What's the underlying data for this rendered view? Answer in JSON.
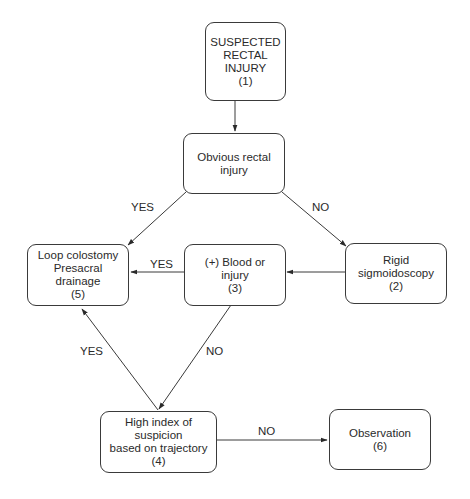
{
  "diagram": {
    "nodes": [
      {
        "id": "1",
        "lines": [
          "SUSPECTED",
          "RECTAL",
          "INJURY",
          "(1)"
        ]
      },
      {
        "id": "obvious",
        "lines": [
          "Obvious rectal",
          "injury"
        ]
      },
      {
        "id": "2",
        "lines": [
          "Rigid",
          "sigmoidoscopy",
          "(2)"
        ]
      },
      {
        "id": "3",
        "lines": [
          "(+) Blood or",
          "injury",
          "(3)"
        ]
      },
      {
        "id": "5",
        "lines": [
          "Loop colostomy",
          "Presacral",
          "drainage",
          "(5)"
        ]
      },
      {
        "id": "4",
        "lines": [
          "High index of suspicion",
          "based on trajectory",
          "(4)"
        ]
      },
      {
        "id": "6",
        "lines": [
          "Observation",
          "(6)"
        ]
      }
    ],
    "edges": [
      {
        "from": "1",
        "to": "obvious",
        "label": ""
      },
      {
        "from": "obvious",
        "to": "5",
        "label": "YES"
      },
      {
        "from": "obvious",
        "to": "2",
        "label": "NO"
      },
      {
        "from": "2",
        "to": "3",
        "label": ""
      },
      {
        "from": "3",
        "to": "5",
        "label": "YES"
      },
      {
        "from": "3",
        "to": "4",
        "label": "NO"
      },
      {
        "from": "4",
        "to": "5",
        "label": "YES"
      },
      {
        "from": "4",
        "to": "6",
        "label": "NO"
      }
    ]
  }
}
